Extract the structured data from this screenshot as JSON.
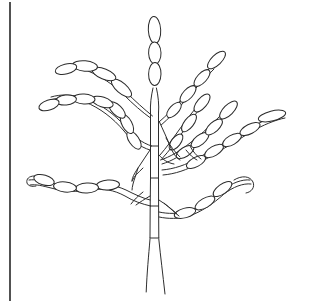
{
  "figure": {
    "title": "Botanical line drawing of a branched plant",
    "subject_name": "branched-plant-specimen",
    "illustration_style": "ink line drawing, unshaded outline",
    "background_color": "#ffffff",
    "ink_color": "#2e2e2e",
    "canvas": {
      "width": 311,
      "height": 303
    }
  },
  "page_border": {
    "name": "left-page-border",
    "orientation": "vertical",
    "x": 10,
    "y_top": 2,
    "y_bottom": 301,
    "color": "#262626"
  },
  "plant": {
    "common_label": "plant-specimen",
    "main_stem": {
      "name": "central-stem",
      "description": "jointed double-line culm with horizontal nodes",
      "node_count": 5,
      "base_split": true,
      "top_y": 110,
      "base_y": 300
    },
    "terminal_spike": {
      "name": "terminal-spike",
      "pod_count": 3,
      "orientation": "vertical",
      "top_y": 18
    },
    "branches": [
      {
        "id": "branch-upper-left-1",
        "side": "left",
        "pod_count": 4,
        "direction": "up-left",
        "tip_x": 62,
        "tip_y": 68
      },
      {
        "id": "branch-upper-left-2",
        "side": "left",
        "pod_count": 7,
        "direction": "left",
        "tip_x": 42,
        "tip_y": 104
      },
      {
        "id": "branch-lower-left-1",
        "side": "left",
        "pod_count": 4,
        "direction": "down-left",
        "tip_x": 25,
        "tip_y": 178
      },
      {
        "id": "branch-upper-right-1",
        "side": "right",
        "pod_count": 4,
        "direction": "up-right",
        "tip_x": 222,
        "tip_y": 52
      },
      {
        "id": "branch-upper-right-2",
        "side": "right",
        "pod_count": 3,
        "direction": "up-right",
        "tip_x": 206,
        "tip_y": 90
      },
      {
        "id": "branch-mid-right-1",
        "side": "right",
        "pod_count": 4,
        "direction": "right",
        "tip_x": 237,
        "tip_y": 86
      },
      {
        "id": "branch-mid-right-2",
        "side": "right",
        "pod_count": 5,
        "direction": "right",
        "tip_x": 288,
        "tip_y": 110
      },
      {
        "id": "branch-lower-right-1",
        "side": "right",
        "pod_count": 3,
        "direction": "down-right",
        "tip_x": 252,
        "tip_y": 190
      }
    ],
    "total_pods": 37,
    "pod_shape": "elongated ellipse (spikelet)"
  }
}
